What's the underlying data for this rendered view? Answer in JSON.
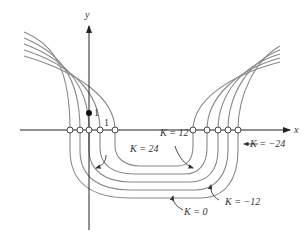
{
  "diagram": {
    "axes": {
      "x_label": "x",
      "y_label": "y"
    },
    "tick_labels": {
      "y_unit": "1",
      "x_unit": "1"
    },
    "curve_labels": [
      {
        "id": "k24",
        "text": "K = 24"
      },
      {
        "id": "k12",
        "text": "K = 12"
      },
      {
        "id": "k0",
        "text": "K = 0"
      },
      {
        "id": "km12",
        "text": "K = −12"
      },
      {
        "id": "km24",
        "text": "K = −24"
      }
    ],
    "level_values": [
      24,
      12,
      0,
      -12,
      -24
    ],
    "stroke_color": "#888888",
    "axis_color": "#222222"
  }
}
